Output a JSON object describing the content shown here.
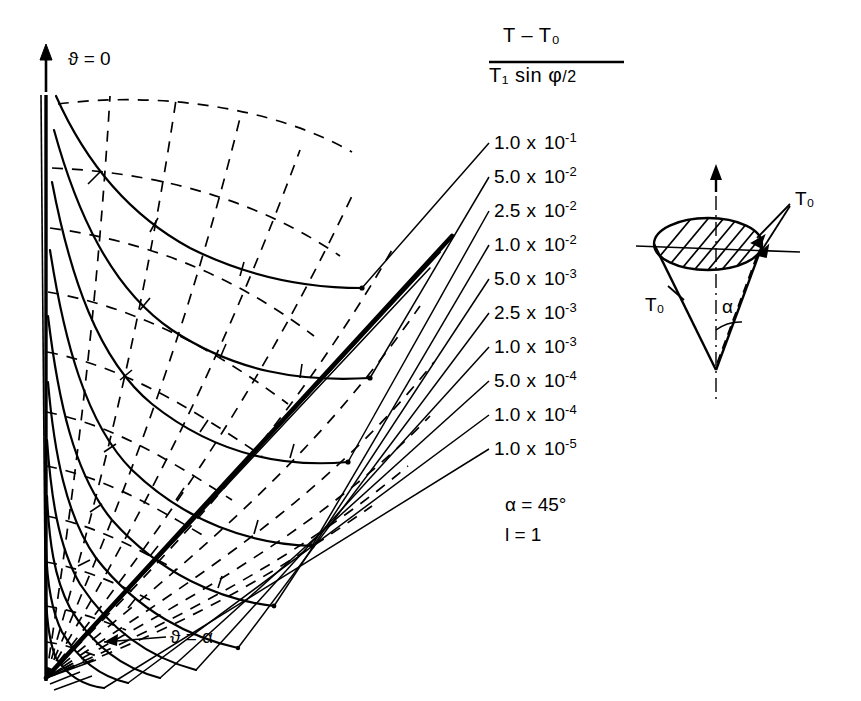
{
  "figure": {
    "title_fraction": {
      "numerator": "T – T₀",
      "denominator_main": "T₁ sin ",
      "denominator_phi": "φ",
      "denominator_tail": "/2"
    },
    "axis_labels": {
      "top": "ϑ = 0",
      "bottom": "ϑ = α"
    },
    "parameters": [
      {
        "text": "α = 45°"
      },
      {
        "text": "l  =  1"
      }
    ],
    "contour_labels": [
      {
        "mantissa": "1.0",
        "times": "x",
        "base": "10",
        "exponent": "-1"
      },
      {
        "mantissa": "5.0",
        "times": "x",
        "base": "10",
        "exponent": "-2"
      },
      {
        "mantissa": "2.5",
        "times": "x",
        "base": "10",
        "exponent": "-2"
      },
      {
        "mantissa": "1.0",
        "times": "x",
        "base": "10",
        "exponent": "-2"
      },
      {
        "mantissa": "5.0",
        "times": "x",
        "base": "10",
        "exponent": "-3"
      },
      {
        "mantissa": "2.5",
        "times": "x",
        "base": "10",
        "exponent": "-3"
      },
      {
        "mantissa": "1.0",
        "times": "x",
        "base": "10",
        "exponent": "-3"
      },
      {
        "mantissa": "5.0",
        "times": "x",
        "base": "10",
        "exponent": "-4"
      },
      {
        "mantissa": "1.0",
        "times": "x",
        "base": "10",
        "exponent": "-4"
      },
      {
        "mantissa": "1.0",
        "times": "x",
        "base": "10",
        "exponent": "-5"
      }
    ],
    "inset": {
      "label_top": "T₀",
      "label_left": "T₀",
      "label_angle": "α"
    },
    "colors": {
      "ink": "#000000",
      "paper": "#ffffff"
    }
  },
  "chart_data": {
    "type": "line",
    "xlabel": "",
    "ylabel": "",
    "grid": "dashed curvilinear mesh",
    "legend": "leader-line callouts at right",
    "annotations": [
      "ϑ = 0",
      "ϑ = α",
      "α = 45°",
      "l = 1"
    ],
    "series": [
      {
        "name": "1.0 x 10^-1",
        "value": 0.1,
        "label_y": 143
      },
      {
        "name": "5.0 x 10^-2",
        "value": 0.05,
        "label_y": 177
      },
      {
        "name": "2.5 x 10^-2",
        "value": 0.025,
        "label_y": 211
      },
      {
        "name": "1.0 x 10^-2",
        "value": 0.01,
        "label_y": 245
      },
      {
        "name": "5.0 x 10^-3",
        "value": 0.005,
        "label_y": 279
      },
      {
        "name": "2.5 x 10^-3",
        "value": 0.0025,
        "label_y": 313
      },
      {
        "name": "1.0 x 10^-3",
        "value": 0.001,
        "label_y": 347
      },
      {
        "name": "5.0 x 10^-4",
        "value": 0.0005,
        "label_y": 381
      },
      {
        "name": "1.0 x 10^-4",
        "value": 0.0001,
        "label_y": 415
      },
      {
        "name": "1.0 x 10^-5",
        "value": 1e-05,
        "label_y": 449
      }
    ]
  }
}
